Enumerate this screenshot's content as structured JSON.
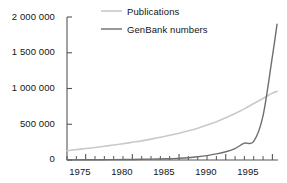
{
  "chart_data": {
    "type": "line",
    "title": "",
    "subtitle": "",
    "xlabel": "",
    "ylabel": "",
    "xlim": [
      1973,
      1995.6
    ],
    "ylim": [
      0,
      2000000
    ],
    "grid": false,
    "legend_position": "top-center",
    "x_ticks_major": [
      1975,
      1980,
      1985,
      1990,
      1995
    ],
    "x_tick_labels": [
      "1975",
      "1980",
      "1985",
      "1990",
      "1995"
    ],
    "x_ticks_minor_step": 1,
    "y_ticks": [
      0,
      500000,
      1000000,
      1500000,
      2000000
    ],
    "y_tick_labels": [
      "0",
      "500 000",
      "1 000 000",
      "1 500 000",
      "2 000 000"
    ],
    "series": [
      {
        "name": "Publications",
        "color": "#c9c9c9",
        "x": [
          1973,
          1974,
          1975,
          1976,
          1977,
          1978,
          1979,
          1980,
          1981,
          1982,
          1983,
          1984,
          1985,
          1986,
          1987,
          1988,
          1989,
          1990,
          1991,
          1992,
          1993,
          1994,
          1995,
          1995.5
        ],
        "values": [
          130000,
          145000,
          160000,
          175000,
          192000,
          210000,
          228000,
          248000,
          268000,
          292000,
          318000,
          345000,
          375000,
          408000,
          445000,
          488000,
          535000,
          590000,
          650000,
          715000,
          790000,
          860000,
          935000,
          960000
        ]
      },
      {
        "name": "GenBank numbers",
        "color": "#6e6e6e",
        "x": [
          1973,
          1975,
          1978,
          1980,
          1982,
          1984,
          1985,
          1986,
          1987,
          1988,
          1989,
          1990,
          1991,
          1992,
          1993,
          1994,
          1995,
          1995.5
        ],
        "values": [
          2000,
          3000,
          5000,
          8000,
          12000,
          18000,
          24000,
          32000,
          45000,
          62000,
          85000,
          115000,
          160000,
          235000,
          260000,
          620000,
          1450000,
          1900000
        ]
      }
    ]
  },
  "legend": {
    "entries": [
      {
        "label": "Publications",
        "color": "#c9c9c9"
      },
      {
        "label": "GenBank numbers",
        "color": "#6e6e6e"
      }
    ]
  },
  "axes": {
    "y_labels": [
      "2 000 000",
      "1 500 000",
      "1 000 000",
      "500 000",
      "0"
    ],
    "x_labels": [
      "1975",
      "1980",
      "1985",
      "1990",
      "1995"
    ]
  }
}
